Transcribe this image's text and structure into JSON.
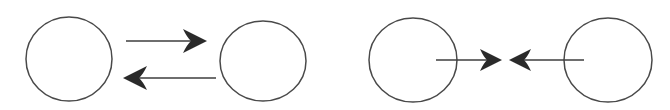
{
  "figure": {
    "type": "line-diagram",
    "background_color": "#ffffff",
    "stroke_color": "#3a3a3a",
    "fill_color": "#2b2b2b",
    "width": 670,
    "height": 110,
    "panel_count": 2
  },
  "style": {
    "circle_stroke_width": 1.5,
    "shaft_stroke_width": 1.6,
    "circle_stroke_color": "#4a4a4a",
    "shaft_stroke_color": "#3f3f3f",
    "arrowhead_fill_color": "#2b2b2b"
  },
  "panels": [
    {
      "id": "panel-left",
      "name": "separated-pair",
      "relation": "two-parallel-opposing-arrows",
      "nodes": [
        {
          "id": "node-left-a",
          "cx": 69,
          "cy": 59,
          "rx": 43,
          "ry": 42
        },
        {
          "id": "node-left-b",
          "cx": 263,
          "cy": 61,
          "rx": 43,
          "ry": 40
        }
      ],
      "arrows": [
        {
          "id": "arrow-left-top",
          "direction": "right",
          "tail_x": 126,
          "tip_x": 207,
          "y": 41,
          "head_length": 24,
          "head_half_width": 12,
          "head_notch": 8,
          "starts_inside_node": false
        },
        {
          "id": "arrow-left-bottom",
          "direction": "left",
          "tail_x": 216,
          "tip_x": 123,
          "y": 78,
          "head_length": 24,
          "head_half_width": 12,
          "head_notch": 8,
          "starts_inside_node": false
        }
      ]
    },
    {
      "id": "panel-right",
      "name": "converging-pair",
      "relation": "two-arrows-pointing-inward",
      "nodes": [
        {
          "id": "node-right-a",
          "cx": 413,
          "cy": 60,
          "rx": 44,
          "ry": 42
        },
        {
          "id": "node-right-b",
          "cx": 608,
          "cy": 60,
          "rx": 44,
          "ry": 42
        }
      ],
      "arrows": [
        {
          "id": "arrow-right-inner-left",
          "direction": "right",
          "tail_x": 436,
          "tip_x": 502,
          "y": 60,
          "head_length": 22,
          "head_half_width": 11,
          "head_notch": 7,
          "starts_inside_node": true
        },
        {
          "id": "arrow-right-inner-right",
          "direction": "left",
          "tail_x": 584,
          "tip_x": 509,
          "y": 60,
          "head_length": 22,
          "head_half_width": 11,
          "head_notch": 7,
          "starts_inside_node": true
        }
      ]
    }
  ]
}
